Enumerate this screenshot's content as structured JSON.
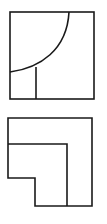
{
  "diagram": {
    "stroke_color": "#1a1a1a",
    "background": "#ffffff",
    "views": [
      {
        "name": "upper-view",
        "outer_rect": {
          "x": 10,
          "y": 12,
          "w": 84,
          "h": 87
        },
        "arc": {
          "from": [
            69,
            12
          ],
          "to": [
            10,
            72
          ]
        },
        "vertical_line": {
          "from": [
            36,
            67
          ],
          "to": [
            36,
            99
          ]
        }
      },
      {
        "name": "lower-view",
        "outline": [
          [
            8,
            118
          ],
          [
            92,
            118
          ],
          [
            92,
            206
          ],
          [
            35,
            206
          ],
          [
            35,
            178
          ],
          [
            8,
            178
          ]
        ],
        "inner_line": [
          [
            8,
            144
          ],
          [
            67,
            144
          ],
          [
            67,
            206
          ]
        ]
      }
    ]
  }
}
